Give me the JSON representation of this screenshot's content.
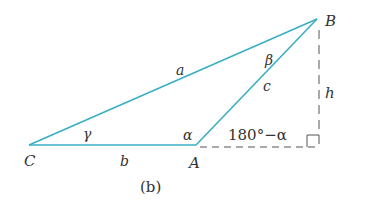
{
  "figure": {
    "caption": "(b)",
    "vertices": {
      "C": {
        "label": "C",
        "x": 29,
        "y": 145
      },
      "A": {
        "label": "A",
        "x": 196,
        "y": 145
      },
      "B": {
        "label": "B",
        "x": 317,
        "y": 19
      }
    },
    "foot": {
      "x": 319,
      "y": 147
    },
    "sides": {
      "a": "a",
      "b": "b",
      "c": "c",
      "h": "h"
    },
    "angles": {
      "alpha": "α",
      "beta": "β",
      "gamma": "γ",
      "exterior": "180°−α"
    },
    "colors": {
      "triangle": "#3aaec4",
      "dashed": "#555555",
      "text": "#333333"
    }
  }
}
